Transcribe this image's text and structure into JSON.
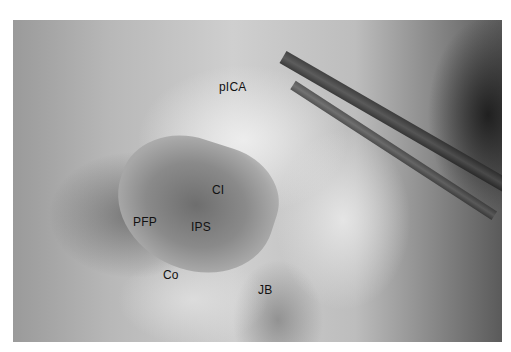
{
  "figure": {
    "type": "anatomical-photograph",
    "labels": [
      {
        "id": "pICA",
        "text": "pICA",
        "x": 219,
        "y": 87
      },
      {
        "id": "CI",
        "text": "CI",
        "x": 212,
        "y": 190
      },
      {
        "id": "PFP",
        "text": "PFP",
        "x": 133,
        "y": 222
      },
      {
        "id": "IPS",
        "text": "IPS",
        "x": 191,
        "y": 227
      },
      {
        "id": "Co",
        "text": "Co",
        "x": 163,
        "y": 275
      },
      {
        "id": "JB",
        "text": "JB",
        "x": 258,
        "y": 290
      }
    ]
  }
}
